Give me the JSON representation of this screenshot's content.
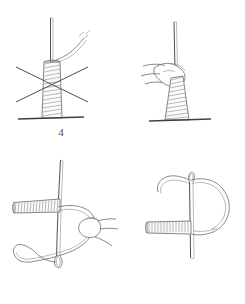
{
  "document": {
    "type": "instructional-diagram",
    "subject": "sewing-thread-wrap-knot-steps",
    "background_color": "#ffffff",
    "ink_color": "#6b6b6b",
    "label_color": "#4a4a4a"
  },
  "panels": [
    {
      "id": "panel-4",
      "number": "4",
      "caption": "",
      "elements": [
        "vertical-needle",
        "wrapped-coil",
        "thread-tail-curving-right",
        "cut-thread-marks",
        "crossing-x-strands",
        "fabric-base-line"
      ]
    },
    {
      "id": "panel-5",
      "number": "5",
      "caption": "",
      "elements": [
        "vertical-needle",
        "fingers-pinching-coil",
        "wrapped-coil",
        "fabric-base-line"
      ]
    },
    {
      "id": "panel-6",
      "number": "6",
      "caption": "",
      "elements": [
        "long-needle-shaft",
        "needle-eye-bottom",
        "horizontal-wrapped-coil",
        "thread-loop",
        "fingers-pulling-thread"
      ]
    },
    {
      "id": "panel-7",
      "number": "7",
      "caption": "",
      "elements": [
        "long-needle-shaft",
        "needle-eye-top",
        "horizontal-wrapped-coil",
        "thread-loop-large"
      ]
    }
  ],
  "labels": {
    "step4": "4",
    "step5": "5",
    "step6": "6",
    "step7": "7"
  }
}
